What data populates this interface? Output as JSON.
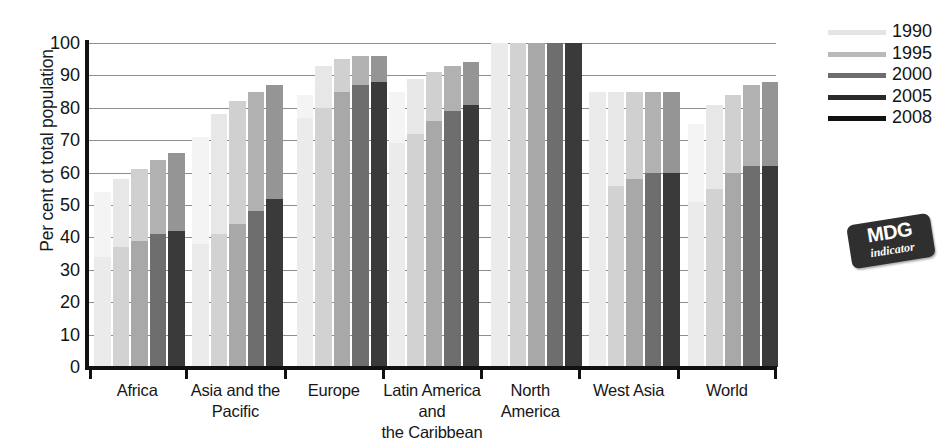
{
  "chart_data": {
    "type": "bar",
    "title": "",
    "subtitle": "",
    "xlabel": "",
    "ylabel": "Per cent ot total population",
    "ylim": [
      0,
      100
    ],
    "yticks": [
      0,
      10,
      20,
      30,
      40,
      50,
      60,
      70,
      80,
      90,
      100
    ],
    "grid": true,
    "legend_position": "right",
    "categories": [
      "Africa",
      "Asia and the\nPacific",
      "Europe",
      "Latin America\nand\nthe Caribbean",
      "North\nAmerica",
      "West Asia",
      "World"
    ],
    "series": [
      {
        "name": "1990",
        "color": "#ebebeb",
        "values_total": [
          54,
          71,
          84,
          85,
          100,
          85,
          75
        ],
        "values_lower": [
          34,
          38,
          77,
          69,
          100,
          85,
          51
        ]
      },
      {
        "name": "1995",
        "color": "#d2d2d2",
        "values_total": [
          58,
          78,
          93,
          89,
          100,
          85,
          81
        ],
        "values_lower": [
          37,
          41,
          80,
          72,
          100,
          56,
          55
        ]
      },
      {
        "name": "2000",
        "color": "#a8a8a8",
        "values_total": [
          61,
          82,
          95,
          91,
          100,
          85,
          84
        ],
        "values_lower": [
          39,
          44,
          85,
          76,
          100,
          58,
          60
        ]
      },
      {
        "name": "2005",
        "color": "#6e6e6e",
        "values_total": [
          64,
          85,
          96,
          93,
          100,
          85,
          87
        ],
        "values_lower": [
          41,
          48,
          87,
          79,
          100,
          60,
          62
        ]
      },
      {
        "name": "2008",
        "color": "#3a3a3a",
        "values_total": [
          66,
          87,
          96,
          94,
          100,
          85,
          88
        ],
        "values_lower": [
          42,
          52,
          88,
          81,
          100,
          60,
          62
        ]
      }
    ]
  },
  "axis": {
    "y_title": "Per cent ot total population",
    "y_tick_labels": [
      "100",
      "90",
      "80",
      "70",
      "60",
      "50",
      "40",
      "30",
      "20",
      "10",
      "0"
    ],
    "x_tick_labels": [
      [
        "Africa"
      ],
      [
        "Asia and the",
        "Pacific"
      ],
      [
        "Europe"
      ],
      [
        "Latin America",
        "and",
        "the Caribbean"
      ],
      [
        "North",
        "America"
      ],
      [
        "West Asia"
      ],
      [
        "World"
      ]
    ]
  },
  "legend": {
    "items": [
      {
        "label": "1990",
        "color": "#e4e4e4"
      },
      {
        "label": "1995",
        "color": "#b9b9b9"
      },
      {
        "label": "2000",
        "color": "#6d6d6d"
      },
      {
        "label": "2005",
        "color": "#2a2a2a"
      },
      {
        "label": "2008",
        "color": "#111111"
      }
    ]
  },
  "badge": {
    "title": "MDG",
    "subtitle": "indicator",
    "bg_color": "#2f2f2f",
    "text_color": "#ffffff"
  },
  "palette": {
    "grid": "#8e8e8e",
    "axis": "#111111",
    "plot_bg": "#ffffff",
    "text": "#141414"
  }
}
